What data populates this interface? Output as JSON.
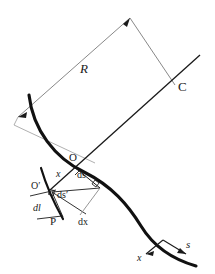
{
  "figure": {
    "background_color": "#ffffff",
    "ink_color": "#1a1a1a",
    "thin_line_color": "#6f6f6f",
    "curve_color": "#111111",
    "width": 215,
    "height": 274
  },
  "labels": {
    "radius": "R",
    "center": "C",
    "point_o": "O",
    "point_o_prime": "O′",
    "point_p": "P",
    "arc_ds": "ds",
    "arc_ds_prime": "ds′",
    "delta_dl": "dl",
    "delta_dx": "dx",
    "offset_x": "x",
    "axis_x": "x",
    "axis_s": "s"
  },
  "annotations": {
    "right_angle_at_o": "right-angle mark at O",
    "right_angle_at_ds": "right-angle mark on ds segment",
    "right_angle_at_o_prime": "right-angle mark at O′",
    "arrow_top": "arrowhead at radius apex",
    "arrow_left": "arrowhead at radius left end",
    "arrow_axis_x": "arrowhead on x axis",
    "arrow_axis_s": "arrowhead on s axis"
  }
}
